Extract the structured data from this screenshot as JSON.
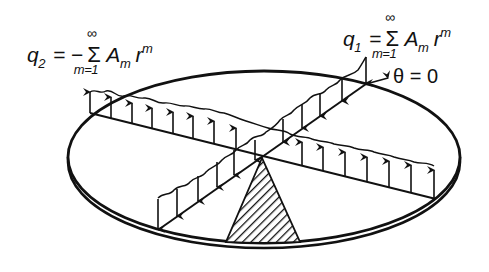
{
  "diagram": {
    "type": "circular plate loaded along two diametral lines (antisymmetric line loads)",
    "labels": {
      "q2": {
        "lhs": "q",
        "lhs_sub": "2",
        "eq": "=",
        "sign": "−",
        "sum": "Σ",
        "sum_upper": "∞",
        "sum_lower": "m=1",
        "term": "A",
        "term_sub": "m",
        "r": "r",
        "r_sup": "m"
      },
      "q1": {
        "lhs": "q",
        "lhs_sub": "1",
        "eq": "=",
        "sum": "Σ",
        "sum_upper": "∞",
        "sum_lower": "m=1",
        "term": "A",
        "term_sub": "m",
        "r": "r",
        "r_sup": "m"
      },
      "theta": "θ = 0"
    },
    "elements": [
      "elliptical plate (isometric circular disk) with thickness",
      "diametral line along θ = 0 with downward arrows (q1)",
      "diametral line perpendicular with upward arrows (q2)",
      "hatched triangular wedge (sector) from center to edge",
      "arrow indicating θ = 0 direction"
    ],
    "colors": {
      "ink": "#111111",
      "background": "#ffffff"
    }
  }
}
